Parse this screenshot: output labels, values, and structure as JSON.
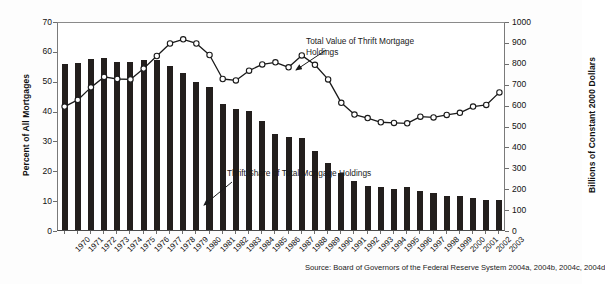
{
  "chart_data": {
    "type": "bar",
    "title": "",
    "subtitle": "",
    "xlabel": "",
    "ylabel": "Percent of All Mortgages",
    "ylabel_secondary": "Billions of Constant 2000 Dollars",
    "ylim": [
      0,
      70
    ],
    "ylim_secondary": [
      0,
      1000
    ],
    "yticks": [
      0,
      10,
      20,
      30,
      40,
      50,
      60,
      70
    ],
    "yticks_secondary": [
      0,
      100,
      200,
      300,
      400,
      500,
      600,
      700,
      800,
      900,
      1000
    ],
    "grid": false,
    "legend_position": "annotated-inline",
    "categories": [
      "1970",
      "1971",
      "1972",
      "1973",
      "1974",
      "1975",
      "1976",
      "1977",
      "1978",
      "1979",
      "1980",
      "1981",
      "1982",
      "1983",
      "1984",
      "1985",
      "1986",
      "1987",
      "1988",
      "1989",
      "1990",
      "1991",
      "1992",
      "1993",
      "1994",
      "1995",
      "1996",
      "1997",
      "1998",
      "1999",
      "2000",
      "2001",
      "2002",
      "2003"
    ],
    "series": [
      {
        "name": "Thrift Share of Total Mortgage Holdings",
        "axis": "left",
        "unit": "Percent of All Mortgages",
        "render": "bar",
        "color": "#231f1d",
        "values": [
          55.5,
          56.0,
          57.2,
          57.5,
          56.2,
          56.3,
          57.0,
          57.0,
          55.1,
          52.5,
          49.5,
          47.8,
          42.3,
          40.6,
          39.9,
          36.5,
          32.2,
          31.0,
          30.8,
          26.5,
          22.6,
          19.0,
          16.5,
          14.9,
          14.4,
          13.7,
          14.4,
          13.2,
          12.5,
          11.5,
          11.4,
          10.7,
          10.1,
          9.9
        ]
      },
      {
        "name": "Total Value of Thrift Mortgage Holdings",
        "axis": "right",
        "unit": "Billions of Constant 2000 Dollars",
        "render": "line-marker",
        "color": "#1a1a1a",
        "marker": "open-circle",
        "values": [
          600,
          632,
          692,
          742,
          732,
          730,
          782,
          842,
          902,
          922,
          902,
          847,
          732,
          725,
          772,
          802,
          812,
          788,
          845,
          800,
          730,
          618,
          562,
          545,
          525,
          522,
          520,
          552,
          548,
          560,
          570,
          600,
          608,
          668
        ]
      }
    ],
    "annotations": [
      {
        "id": "annot-line",
        "text": "Total Value of Thrift Mortgage\nHoldings",
        "points_to": "line-series"
      },
      {
        "id": "annot-bars",
        "text": "Thrift Share of Total Mortgage Holdings",
        "points_to": "bar-series"
      }
    ],
    "source": "Source: Board of Governors of the Federal Reserve System 2004a, 2004b, 2004c, 2004d"
  },
  "figure": {
    "axis_left_title": "Percent of All Mortgages",
    "axis_right_title": "Billions of Constant 2000 Dollars",
    "source_note": "Source: Board of Governors of the Federal Reserve System 2004a, 2004b, 2004c, 2004d",
    "annotation_line": "Total Value of Thrift Mortgage\nHoldings",
    "annotation_bars": "Thrift Share of Total Mortgage Holdings"
  }
}
